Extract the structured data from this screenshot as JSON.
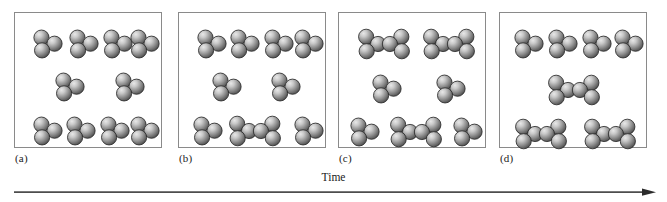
{
  "figure": {
    "type": "molecular-reaction-time-sequence",
    "background_color": "#ffffff",
    "panel_border_color": "#8a8a8a",
    "sphere_color": "#8f8f8f",
    "sphere_highlight_color": "#e8e8e8",
    "sphere_shadow_color": "#4a4a4a",
    "sphere_outline_color": "#2b2b2b",
    "sphere_radius": 7.6,
    "axis": {
      "label": "Time",
      "direction": "left-to-right",
      "arrow_color": "#4d4d4d"
    },
    "panels": [
      {
        "label": "(a)",
        "name": "panel-a",
        "molecule_counts": {
          "triatomic": 10,
          "hexatomic_dimer": 0
        },
        "molecules": [
          {
            "type": "triatomic",
            "x": 33,
            "y": 33
          },
          {
            "type": "triatomic",
            "x": 69,
            "y": 33
          },
          {
            "type": "triatomic",
            "x": 103,
            "y": 33
          },
          {
            "type": "triatomic",
            "x": 130,
            "y": 33
          },
          {
            "type": "triatomic",
            "x": 55,
            "y": 76
          },
          {
            "type": "triatomic",
            "x": 115,
            "y": 76
          },
          {
            "type": "triatomic",
            "x": 33,
            "y": 120
          },
          {
            "type": "triatomic",
            "x": 66,
            "y": 120
          },
          {
            "type": "triatomic",
            "x": 100,
            "y": 120
          },
          {
            "type": "triatomic",
            "x": 130,
            "y": 120
          }
        ]
      },
      {
        "label": "(b)",
        "name": "panel-b",
        "molecule_counts": {
          "triatomic": 8,
          "hexatomic_dimer": 1
        },
        "molecules": [
          {
            "type": "triatomic",
            "x": 33,
            "y": 33
          },
          {
            "type": "triatomic",
            "x": 66,
            "y": 33
          },
          {
            "type": "triatomic",
            "x": 100,
            "y": 33
          },
          {
            "type": "triatomic",
            "x": 130,
            "y": 33
          },
          {
            "type": "triatomic",
            "x": 48,
            "y": 76
          },
          {
            "type": "triatomic",
            "x": 107,
            "y": 76
          },
          {
            "type": "triatomic",
            "x": 29,
            "y": 120
          },
          {
            "type": "hexatomic_dimer",
            "x": 76,
            "y": 120
          },
          {
            "type": "triatomic",
            "x": 130,
            "y": 120
          }
        ]
      },
      {
        "label": "(c)",
        "name": "panel-c",
        "molecule_counts": {
          "triatomic": 4,
          "hexatomic_dimer": 3
        },
        "molecules": [
          {
            "type": "hexatomic_dimer",
            "x": 45,
            "y": 33
          },
          {
            "type": "hexatomic_dimer",
            "x": 110,
            "y": 33
          },
          {
            "type": "triatomic",
            "x": 48,
            "y": 78
          },
          {
            "type": "triatomic",
            "x": 112,
            "y": 78
          },
          {
            "type": "triatomic",
            "x": 26,
            "y": 121
          },
          {
            "type": "hexatomic_dimer",
            "x": 77,
            "y": 121
          },
          {
            "type": "triatomic",
            "x": 129,
            "y": 121
          }
        ]
      },
      {
        "label": "(d)",
        "name": "panel-d",
        "molecule_counts": {
          "triatomic": 4,
          "hexatomic_dimer": 3
        },
        "molecules": [
          {
            "type": "triatomic",
            "x": 29,
            "y": 33
          },
          {
            "type": "triatomic",
            "x": 63,
            "y": 33
          },
          {
            "type": "triatomic",
            "x": 97,
            "y": 33
          },
          {
            "type": "triatomic",
            "x": 129,
            "y": 33
          },
          {
            "type": "hexatomic_dimer",
            "x": 74,
            "y": 79
          },
          {
            "type": "hexatomic_dimer",
            "x": 41,
            "y": 123
          },
          {
            "type": "hexatomic_dimer",
            "x": 110,
            "y": 123
          }
        ]
      }
    ]
  }
}
